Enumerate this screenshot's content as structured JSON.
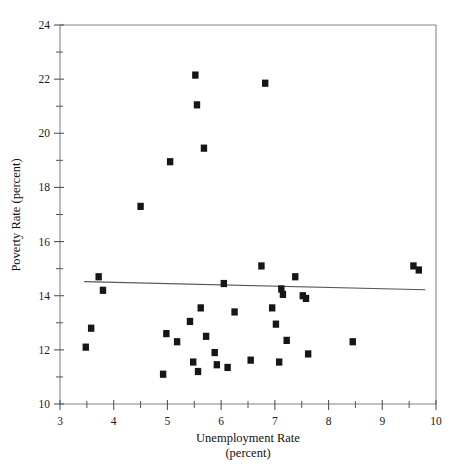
{
  "figure": {
    "top_caption": "",
    "background_color": "#ffffff",
    "marker_color": "#161616",
    "line_color": "#55555a",
    "axis_color": "#6e6e72"
  },
  "chart_data": {
    "type": "scatter",
    "title": "",
    "xlabel": "Unemployment Rate",
    "xlabel_sub": "(percent)",
    "ylabel": "Poverty Rate (percent)",
    "xlim": [
      3,
      10
    ],
    "ylim": [
      10,
      24
    ],
    "xticks": [
      3,
      4,
      5,
      6,
      7,
      8,
      9,
      10
    ],
    "xtick_labels": [
      "3",
      "4",
      "5",
      "6",
      "7",
      "8",
      "9",
      "10"
    ],
    "xminor_ticks": [
      3.5,
      4.5,
      5.5,
      6.5,
      7.5,
      8.5,
      9.5
    ],
    "yticks": [
      10,
      12,
      14,
      16,
      18,
      20,
      22,
      24
    ],
    "ytick_labels": [
      "10",
      "12",
      "14",
      "16",
      "18",
      "20",
      "22",
      "24"
    ],
    "yminor_ticks": [
      11,
      13,
      15,
      17,
      19,
      21,
      23
    ],
    "grid": false,
    "legend": null,
    "marker_shape": "square",
    "points": [
      {
        "x": 3.48,
        "y": 12.1
      },
      {
        "x": 3.58,
        "y": 12.8
      },
      {
        "x": 3.72,
        "y": 14.7
      },
      {
        "x": 3.8,
        "y": 14.2
      },
      {
        "x": 4.5,
        "y": 17.3
      },
      {
        "x": 4.92,
        "y": 11.1
      },
      {
        "x": 4.98,
        "y": 12.6
      },
      {
        "x": 5.05,
        "y": 18.95
      },
      {
        "x": 5.18,
        "y": 12.3
      },
      {
        "x": 5.42,
        "y": 13.05
      },
      {
        "x": 5.48,
        "y": 11.55
      },
      {
        "x": 5.52,
        "y": 22.15
      },
      {
        "x": 5.55,
        "y": 21.05
      },
      {
        "x": 5.57,
        "y": 11.2
      },
      {
        "x": 5.62,
        "y": 13.55
      },
      {
        "x": 5.68,
        "y": 19.45
      },
      {
        "x": 5.72,
        "y": 12.5
      },
      {
        "x": 5.88,
        "y": 11.9
      },
      {
        "x": 5.92,
        "y": 11.45
      },
      {
        "x": 6.05,
        "y": 14.45
      },
      {
        "x": 6.12,
        "y": 11.35
      },
      {
        "x": 6.25,
        "y": 13.4
      },
      {
        "x": 6.55,
        "y": 11.62
      },
      {
        "x": 6.75,
        "y": 15.1
      },
      {
        "x": 6.82,
        "y": 21.85
      },
      {
        "x": 6.95,
        "y": 13.55
      },
      {
        "x": 7.02,
        "y": 12.95
      },
      {
        "x": 7.08,
        "y": 11.55
      },
      {
        "x": 7.12,
        "y": 14.25
      },
      {
        "x": 7.15,
        "y": 14.05
      },
      {
        "x": 7.22,
        "y": 12.35
      },
      {
        "x": 7.38,
        "y": 14.7
      },
      {
        "x": 7.52,
        "y": 14.0
      },
      {
        "x": 7.58,
        "y": 13.9
      },
      {
        "x": 7.62,
        "y": 11.85
      },
      {
        "x": 8.45,
        "y": 12.3
      },
      {
        "x": 9.58,
        "y": 15.1
      },
      {
        "x": 9.68,
        "y": 14.95
      }
    ],
    "fit_line": {
      "label": "regression line",
      "x_start": 3.45,
      "y_start": 14.52,
      "x_end": 9.8,
      "y_end": 14.22
    }
  }
}
